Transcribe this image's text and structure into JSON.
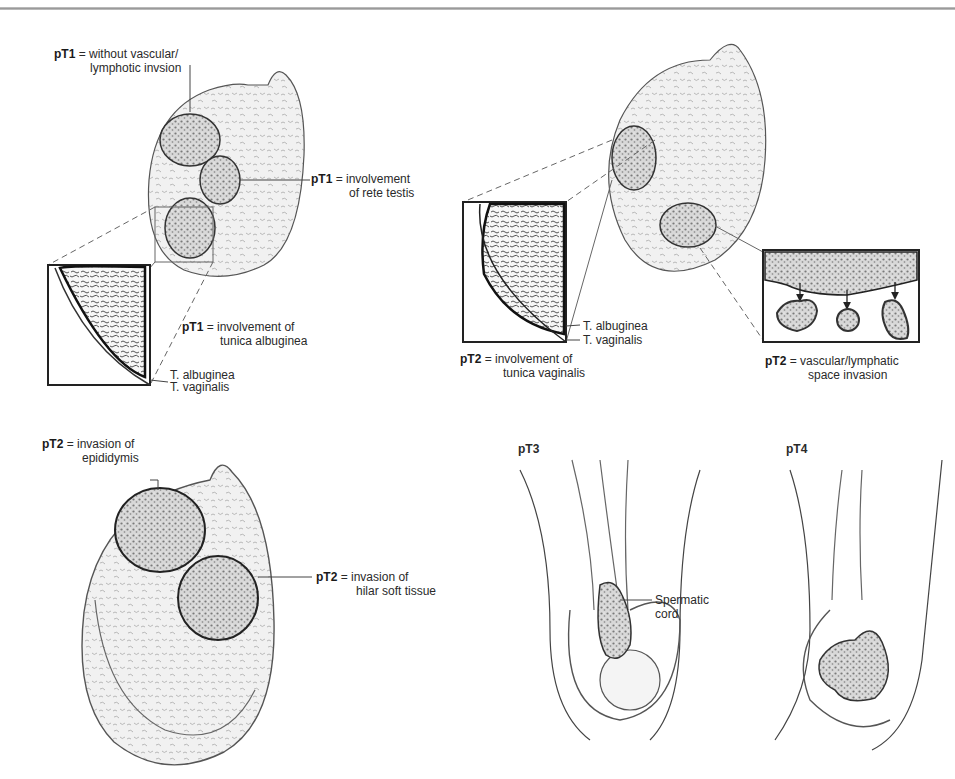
{
  "figure": {
    "panels": [
      {
        "id": "pT1",
        "labels": [
          {
            "stage": "pT1",
            "sep": " = ",
            "line1": "without vascular/",
            "line2": "lymphotic invsion"
          },
          {
            "stage": "pT1",
            "sep": " = ",
            "line1": "involvement",
            "line2": "of rete testis"
          },
          {
            "stage": "pT1",
            "sep": " = ",
            "line1": "involvement of",
            "line2": "tunica albuginea"
          }
        ],
        "layers": [
          "T. albuginea",
          "T. vaginalis"
        ]
      },
      {
        "id": "pT2-top",
        "labels": [
          {
            "stage": "pT2",
            "sep": " = ",
            "line1": "involvement of",
            "line2": "tunica vaginalis"
          },
          {
            "stage": "pT2",
            "sep": " = ",
            "line1": "vascular/lymphatic",
            "line2": "space invasion"
          }
        ],
        "layers": [
          "T. albuginea",
          "T. vaginalis"
        ]
      },
      {
        "id": "pT2-bottom",
        "labels": [
          {
            "stage": "pT2",
            "sep": " = ",
            "line1": "invasion of",
            "line2": "epididymis"
          },
          {
            "stage": "pT2",
            "sep": " = ",
            "line1": "invasion of",
            "line2": "hilar soft tissue"
          }
        ]
      },
      {
        "id": "pT3",
        "title": "pT3",
        "annotation": {
          "line1": "Spermatic",
          "line2": "cord"
        }
      },
      {
        "id": "pT4",
        "title": "pT4"
      }
    ]
  }
}
